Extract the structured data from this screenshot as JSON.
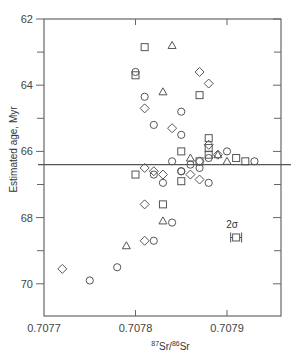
{
  "chart_data": {
    "type": "scatter",
    "title": "",
    "xlabel": "87Sr/86Sr",
    "xlabel_parts": {
      "sup1": "87",
      "base1": "Sr/",
      "sup2": "86",
      "base2": "Sr"
    },
    "ylabel": "Estimated age, Myr",
    "xlim": [
      0.7077,
      0.70796
    ],
    "ylim": [
      62,
      71
    ],
    "y_inverted": true,
    "x_ticks": [
      0.7077,
      0.7078,
      0.7079
    ],
    "x_tick_labels": [
      "0.7077",
      "0.7078",
      "0.7079"
    ],
    "y_ticks": [
      62,
      64,
      66,
      68,
      70
    ],
    "y_tick_labels": [
      "62",
      "64",
      "66",
      "68",
      "70"
    ],
    "y_minor_ticks": [
      63,
      65,
      67,
      69
    ],
    "grid": false,
    "reference_line": {
      "y": 66.4,
      "label": ""
    },
    "error_bar_legend": {
      "label": "2σ",
      "x": 0.70791,
      "y": 68.6,
      "x_err": 6e-06,
      "marker": "square"
    },
    "series": [
      {
        "name": "square",
        "marker": "square",
        "points": [
          [
            0.70781,
            62.85
          ],
          [
            0.7078,
            63.7
          ],
          [
            0.70787,
            64.3
          ],
          [
            0.70785,
            66.9
          ],
          [
            0.70783,
            67.6
          ],
          [
            0.70788,
            66.1
          ],
          [
            0.70788,
            65.9
          ],
          [
            0.70788,
            65.6
          ],
          [
            0.70785,
            66.0
          ],
          [
            0.70787,
            66.3
          ],
          [
            0.70791,
            66.2
          ],
          [
            0.70792,
            66.3
          ],
          [
            0.7078,
            66.7
          ]
        ]
      },
      {
        "name": "triangle",
        "marker": "triangle",
        "points": [
          [
            0.70784,
            62.8
          ],
          [
            0.70783,
            64.2
          ],
          [
            0.70779,
            68.85
          ],
          [
            0.70783,
            68.1
          ],
          [
            0.70789,
            66.1
          ],
          [
            0.70786,
            66.2
          ],
          [
            0.7079,
            66.3
          ]
        ]
      },
      {
        "name": "circle",
        "marker": "circle",
        "points": [
          [
            0.7078,
            63.6
          ],
          [
            0.70781,
            64.35
          ],
          [
            0.70785,
            64.8
          ],
          [
            0.70782,
            65.2
          ],
          [
            0.70785,
            65.5
          ],
          [
            0.7079,
            66.0
          ],
          [
            0.70782,
            66.7
          ],
          [
            0.70783,
            66.95
          ],
          [
            0.70785,
            66.6
          ],
          [
            0.70788,
            66.95
          ],
          [
            0.70784,
            68.15
          ],
          [
            0.70782,
            68.7
          ],
          [
            0.70778,
            69.5
          ],
          [
            0.70775,
            69.9
          ],
          [
            0.70784,
            66.3
          ],
          [
            0.70786,
            66.4
          ],
          [
            0.70787,
            66.5
          ],
          [
            0.70793,
            66.3
          ],
          [
            0.70788,
            66.2
          ],
          [
            0.70785,
            66.6
          ]
        ]
      },
      {
        "name": "diamond",
        "marker": "diamond",
        "points": [
          [
            0.70787,
            63.6
          ],
          [
            0.70788,
            63.95
          ],
          [
            0.70781,
            64.7
          ],
          [
            0.70784,
            65.3
          ],
          [
            0.70781,
            66.5
          ],
          [
            0.70782,
            66.6
          ],
          [
            0.70783,
            66.7
          ],
          [
            0.70787,
            66.85
          ],
          [
            0.70786,
            66.7
          ],
          [
            0.70781,
            67.6
          ],
          [
            0.70781,
            68.7
          ],
          [
            0.70772,
            69.55
          ],
          [
            0.70788,
            65.8
          ],
          [
            0.70787,
            66.3
          ],
          [
            0.70789,
            66.1
          ]
        ]
      }
    ]
  }
}
